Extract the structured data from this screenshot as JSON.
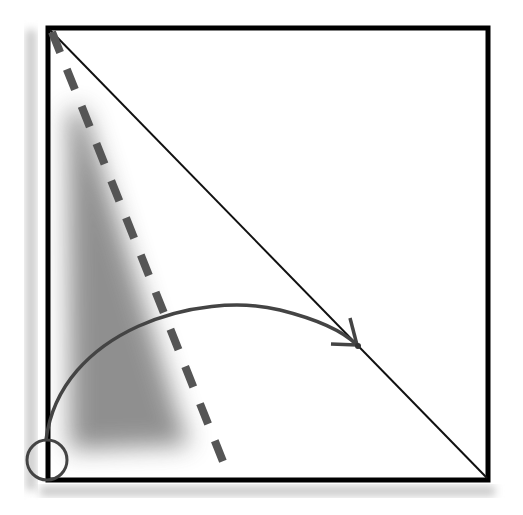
{
  "diagram": {
    "type": "geometric-construction",
    "colors": {
      "square_stroke": "#000000",
      "diagonal_stroke": "#111111",
      "dashed_stroke": "#555555",
      "arc_stroke": "#444444",
      "circle_stroke": "#444444",
      "shading": "#8a8a8a",
      "shadow": "#bdbdbd",
      "background": "#ffffff"
    },
    "square": {
      "x": 48,
      "y": 28,
      "width": 440,
      "height": 452,
      "stroke_width": 5
    },
    "diagonal": {
      "x1": 50,
      "y1": 30,
      "x2": 487,
      "y2": 478
    },
    "dashed_line": {
      "x1": 52,
      "y1": 32,
      "x2": 228,
      "y2": 474
    },
    "arc": {
      "start": [
        46,
        440
      ],
      "control1": [
        70,
        300
      ],
      "control2": [
        280,
        260
      ],
      "end": [
        357,
        345
      ]
    },
    "arrowhead": {
      "tip": [
        357,
        345
      ]
    },
    "corner_circle": {
      "cx": 47,
      "cy": 460,
      "r": 20
    }
  }
}
